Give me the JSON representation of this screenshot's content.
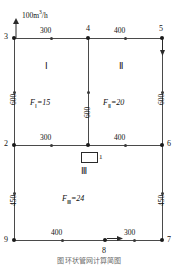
{
  "figure": {
    "unit_label": "100m",
    "unit_sup": "3",
    "unit_suffix": "/h",
    "caption": "图    环状管网计算简图"
  },
  "nodes": [
    {
      "id": "3",
      "label": "3"
    },
    {
      "id": "4",
      "label": "4"
    },
    {
      "id": "5",
      "label": "5"
    },
    {
      "id": "2",
      "label": "2"
    },
    {
      "id": "1",
      "label": "1"
    },
    {
      "id": "6",
      "label": "6"
    },
    {
      "id": "9",
      "label": "9"
    },
    {
      "id": "8",
      "label": "8"
    },
    {
      "id": "7",
      "label": "7"
    }
  ],
  "pipe_lengths": {
    "top_left": "300",
    "top_right": "400",
    "middle_left": "300",
    "middle_right": "400",
    "bottom_left": "400",
    "bottom_right": "300",
    "left_upper": "600",
    "center_upper": "600",
    "right_upper": "600",
    "left_lower": "450",
    "right_lower": "450"
  },
  "loops": [
    {
      "numeral": "Ⅰ",
      "flow_symbol": "F",
      "flow_sub": "Ⅰ",
      "flow_text": "=15"
    },
    {
      "numeral": "Ⅱ",
      "flow_symbol": "F",
      "flow_sub": "Ⅱ",
      "flow_text": "=20"
    },
    {
      "numeral": "Ⅲ",
      "flow_symbol": "F",
      "flow_sub": "Ⅲ",
      "flow_text": "=24"
    }
  ],
  "pump": {
    "label": "1"
  },
  "colors": {
    "pipe": "#4a4a4a",
    "node": "#1a1a1a",
    "text": "#111111",
    "caption": "#6a6a6a"
  }
}
